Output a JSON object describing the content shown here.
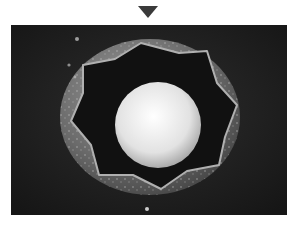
{
  "pointer": {
    "icon": "triangle-down-icon",
    "color": "#3a3a3a"
  },
  "photo": {
    "subject": "grayscale photograph of a round bowl with a star-shaped cavity holding a white sphere",
    "palette": {
      "background": "#1e1e1e",
      "bowl_rim": "#6e6e6e",
      "cavity": "#101010",
      "sphere": "#e8e8e8"
    }
  }
}
